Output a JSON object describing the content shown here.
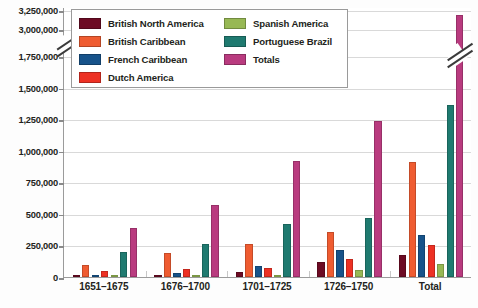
{
  "chart_data": {
    "type": "bar",
    "title": "",
    "xlabel": "",
    "ylabel": "",
    "categories": [
      "1651–1675",
      "1676–1700",
      "1701–1725",
      "1726–1750",
      "Total"
    ],
    "series": [
      {
        "name": "British North America",
        "color": "#6d0b24",
        "values": [
          3000,
          8000,
          40000,
          120000,
          171000
        ]
      },
      {
        "name": "British Caribbean",
        "color": "#ef5c31",
        "values": [
          95000,
          190000,
          265000,
          355000,
          910000
        ]
      },
      {
        "name": "French Caribbean",
        "color": "#17538a",
        "values": [
          12000,
          30000,
          90000,
          215000,
          330000
        ]
      },
      {
        "name": "Dutch America",
        "color": "#ed3124",
        "values": [
          50000,
          65000,
          70000,
          140000,
          250000
        ]
      },
      {
        "name": "Spanish America",
        "color": "#97b854",
        "values": [
          8000,
          12000,
          18000,
          58000,
          105000
        ]
      },
      {
        "name": "Portuguese Brazil",
        "color": "#1f7a70",
        "values": [
          200000,
          260000,
          420000,
          465000,
          1360000
        ]
      },
      {
        "name": "Totals",
        "color": "#b93b7f",
        "values": [
          390000,
          570000,
          915000,
          1235000,
          3180000
        ]
      }
    ],
    "ylim": [
      0,
      1750000
    ],
    "y_ticks": [
      {
        "label": "0",
        "value": 0
      },
      {
        "label": "250,000",
        "value": 250000
      },
      {
        "label": "500,000",
        "value": 500000
      },
      {
        "label": "750,000",
        "value": 750000
      },
      {
        "label": "1,000,000",
        "value": 1000000
      },
      {
        "label": "1,250,000",
        "value": 1250000
      },
      {
        "label": "1,500,000",
        "value": 1500000
      },
      {
        "label": "1,750,000",
        "value": 1750000
      },
      {
        "label": "3,000,000",
        "value": 3000000
      },
      {
        "label": "3,250,000",
        "value": 3250000
      }
    ],
    "axis_break": {
      "between": [
        1750000,
        3000000
      ],
      "present": true
    },
    "grid": true,
    "legend_position": "top-left-inside"
  },
  "legend": {
    "columns": [
      {
        "items": [
          {
            "label": "British North America",
            "color": "#6d0b24"
          },
          {
            "label": "British Caribbean",
            "color": "#ef5c31"
          },
          {
            "label": "French Caribbean",
            "color": "#17538a"
          },
          {
            "label": "Dutch America",
            "color": "#ed3124"
          }
        ]
      },
      {
        "items": [
          {
            "label": "Spanish America",
            "color": "#97b854"
          },
          {
            "label": "Portuguese Brazil",
            "color": "#1f7a70"
          },
          {
            "label": "Totals",
            "color": "#b93b7f"
          }
        ]
      }
    ]
  }
}
